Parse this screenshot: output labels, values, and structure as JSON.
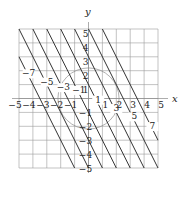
{
  "figure": {
    "type": "contour-diagram",
    "axes": {
      "x_label": "x",
      "y_label": "y",
      "xlim": [
        -5,
        5
      ],
      "ylim": [
        -5,
        5
      ],
      "x_ticks": [
        -5,
        -4,
        -3,
        -2,
        -1,
        1,
        2,
        3,
        4,
        5
      ],
      "x_tick_labels": [
        "−5",
        "−4",
        "−3",
        "−2",
        "−1",
        "1",
        "2",
        "3",
        "4",
        "5"
      ],
      "y_ticks": [
        5,
        4,
        3,
        2,
        1,
        -1,
        -2,
        -3,
        -4,
        -5
      ],
      "y_tick_labels": [
        "5",
        "4",
        "3",
        "2",
        "1",
        "−1",
        "−2",
        "−3",
        "−4",
        "−5"
      ],
      "grid": true,
      "grid_step": 1
    },
    "level_function": "2x + y",
    "level_lines": [
      {
        "c": -7,
        "label": "−7",
        "label_pos": [
          -4.3,
          1.6
        ]
      },
      {
        "c": -5,
        "label": "−5",
        "label_pos": [
          -3.0,
          1.0
        ]
      },
      {
        "c": -3,
        "label": "−3",
        "label_pos": [
          -1.8,
          0.6
        ]
      },
      {
        "c": -1,
        "label": "−1",
        "label_pos": [
          -0.7,
          0.4
        ]
      },
      {
        "c": 1,
        "label": "1",
        "label_pos": [
          0.7,
          -0.3
        ]
      },
      {
        "c": 3,
        "label": "3",
        "label_pos": [
          2.0,
          -0.9
        ]
      },
      {
        "c": 5,
        "label": "5",
        "label_pos": [
          3.3,
          -1.5
        ]
      },
      {
        "c": 7,
        "label": "7",
        "label_pos": [
          4.6,
          -2.2
        ]
      }
    ],
    "circle": {
      "center": [
        0,
        0
      ],
      "radius": 2.2
    },
    "colors": {
      "grid": "#9a9a9a",
      "axis": "#8a8a8a",
      "level_line": "#333333",
      "circle": "#8c8c8c",
      "text": "#222222"
    }
  }
}
